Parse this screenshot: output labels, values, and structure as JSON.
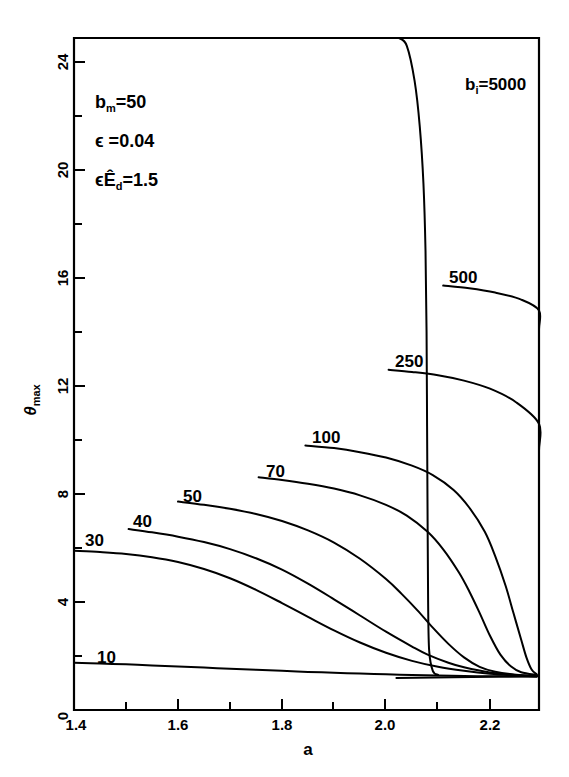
{
  "chart_data": {
    "type": "line",
    "title": "",
    "xlabel": "a",
    "ylabel": "θmax",
    "xlim": [
      1.4,
      2.29
    ],
    "ylim": [
      0,
      25.4
    ],
    "grid": false,
    "legend_position": "inline-curve-labels",
    "xticks": [
      1.4,
      1.6,
      1.8,
      2.0,
      2.2
    ],
    "xticklabels": [
      "1.4",
      "1.6",
      "1.8",
      "2.0",
      "2.2"
    ],
    "x_minor_ticks": [
      1.5,
      1.7,
      1.9,
      2.1,
      2.2
    ],
    "yticks": [
      0,
      4,
      8,
      12,
      16,
      20,
      24
    ],
    "yticklabels": [
      "0",
      "4",
      "8",
      "12",
      "16",
      "20",
      "24"
    ],
    "y_minor_ticks": [
      2,
      6,
      10,
      14,
      18,
      22
    ],
    "origin_label": "0",
    "asymptote_theta": 1.22,
    "series": [
      {
        "name": "10",
        "label": "10",
        "label_x": 1.47,
        "label_y": 2.45,
        "points": [
          [
            1.4,
            1.75
          ],
          [
            1.45,
            1.72
          ],
          [
            1.5,
            1.69
          ],
          [
            1.55,
            1.65
          ],
          [
            1.6,
            1.61
          ],
          [
            1.65,
            1.57
          ],
          [
            1.7,
            1.53
          ],
          [
            1.75,
            1.49
          ],
          [
            1.8,
            1.45
          ],
          [
            1.85,
            1.41
          ],
          [
            1.9,
            1.38
          ],
          [
            1.95,
            1.35
          ],
          [
            2.0,
            1.32
          ],
          [
            2.05,
            1.3
          ],
          [
            2.1,
            1.28
          ],
          [
            2.15,
            1.26
          ],
          [
            2.2,
            1.25
          ],
          [
            2.25,
            1.24
          ],
          [
            2.29,
            1.23
          ]
        ]
      },
      {
        "name": "30",
        "label": "30",
        "label_x": 1.445,
        "label_y": 6.75,
        "points": [
          [
            1.4,
            5.9
          ],
          [
            1.45,
            5.85
          ],
          [
            1.5,
            5.78
          ],
          [
            1.55,
            5.66
          ],
          [
            1.6,
            5.48
          ],
          [
            1.65,
            5.22
          ],
          [
            1.7,
            4.88
          ],
          [
            1.75,
            4.45
          ],
          [
            1.8,
            3.96
          ],
          [
            1.85,
            3.45
          ],
          [
            1.9,
            2.95
          ],
          [
            1.95,
            2.5
          ],
          [
            2.0,
            2.12
          ],
          [
            2.05,
            1.82
          ],
          [
            2.1,
            1.6
          ],
          [
            2.15,
            1.45
          ],
          [
            2.2,
            1.34
          ],
          [
            2.25,
            1.28
          ],
          [
            2.29,
            1.25
          ]
        ]
      },
      {
        "label": "40",
        "name": "40",
        "label_x": 1.54,
        "label_y": 7.45,
        "points": [
          [
            1.505,
            6.7
          ],
          [
            1.55,
            6.58
          ],
          [
            1.6,
            6.42
          ],
          [
            1.65,
            6.22
          ],
          [
            1.7,
            5.96
          ],
          [
            1.75,
            5.62
          ],
          [
            1.8,
            5.2
          ],
          [
            1.85,
            4.68
          ],
          [
            1.9,
            4.1
          ],
          [
            1.95,
            3.5
          ],
          [
            2.0,
            2.9
          ],
          [
            2.05,
            2.35
          ],
          [
            2.08,
            2.05
          ],
          [
            2.12,
            1.75
          ],
          [
            2.15,
            1.58
          ],
          [
            2.2,
            1.39
          ],
          [
            2.25,
            1.3
          ],
          [
            2.29,
            1.26
          ]
        ]
      },
      {
        "label": "50",
        "name": "50",
        "label_x": 1.635,
        "label_y": 8.4,
        "points": [
          [
            1.6,
            7.72
          ],
          [
            1.65,
            7.6
          ],
          [
            1.7,
            7.45
          ],
          [
            1.75,
            7.26
          ],
          [
            1.8,
            7.0
          ],
          [
            1.85,
            6.65
          ],
          [
            1.9,
            6.2
          ],
          [
            1.95,
            5.6
          ],
          [
            2.0,
            4.85
          ],
          [
            2.03,
            4.3
          ],
          [
            2.06,
            3.7
          ],
          [
            2.09,
            3.05
          ],
          [
            2.12,
            2.45
          ],
          [
            2.15,
            1.95
          ],
          [
            2.18,
            1.6
          ],
          [
            2.21,
            1.42
          ],
          [
            2.25,
            1.31
          ],
          [
            2.29,
            1.27
          ]
        ]
      },
      {
        "label": "70",
        "name": "70",
        "label_x": 1.795,
        "label_y": 9.3,
        "points": [
          [
            1.755,
            8.62
          ],
          [
            1.8,
            8.52
          ],
          [
            1.85,
            8.38
          ],
          [
            1.9,
            8.2
          ],
          [
            1.95,
            7.95
          ],
          [
            2.0,
            7.6
          ],
          [
            2.04,
            7.2
          ],
          [
            2.08,
            6.6
          ],
          [
            2.11,
            5.95
          ],
          [
            2.14,
            5.1
          ],
          [
            2.16,
            4.4
          ],
          [
            2.18,
            3.6
          ],
          [
            2.2,
            2.75
          ],
          [
            2.22,
            2.05
          ],
          [
            2.24,
            1.62
          ],
          [
            2.26,
            1.4
          ],
          [
            2.29,
            1.3
          ]
        ]
      },
      {
        "label": "100",
        "name": "100",
        "label_x": 1.885,
        "label_y": 10.55,
        "points": [
          [
            1.845,
            9.8
          ],
          [
            1.9,
            9.7
          ],
          [
            1.95,
            9.55
          ],
          [
            2.0,
            9.35
          ],
          [
            2.05,
            9.05
          ],
          [
            2.09,
            8.7
          ],
          [
            2.13,
            8.15
          ],
          [
            2.16,
            7.5
          ],
          [
            2.19,
            6.6
          ],
          [
            2.21,
            5.7
          ],
          [
            2.23,
            4.6
          ],
          [
            2.245,
            3.6
          ],
          [
            2.26,
            2.6
          ],
          [
            2.27,
            1.95
          ],
          [
            2.28,
            1.5
          ],
          [
            2.29,
            1.32
          ]
        ]
      },
      {
        "label": "250",
        "name": "250",
        "label_x": 2.045,
        "label_y": 13.4,
        "points": [
          [
            2.005,
            12.6
          ],
          [
            2.05,
            12.52
          ],
          [
            2.1,
            12.4
          ],
          [
            2.15,
            12.2
          ],
          [
            2.2,
            11.9
          ],
          [
            2.25,
            11.4
          ],
          [
            2.3,
            10.6
          ],
          [
            2.33,
            9.6
          ],
          [
            2.355,
            8.3
          ],
          [
            2.37,
            6.8
          ],
          [
            2.382,
            5.2
          ],
          [
            2.39,
            3.7
          ],
          [
            2.397,
            2.4
          ],
          [
            2.402,
            1.6
          ],
          [
            2.41,
            1.3
          ]
        ]
      },
      {
        "label": "500",
        "name": "500",
        "label_x": 2.15,
        "label_y": 16.5,
        "points": [
          [
            2.11,
            15.72
          ],
          [
            2.16,
            15.62
          ],
          [
            2.21,
            15.46
          ],
          [
            2.26,
            15.2
          ],
          [
            2.31,
            14.8
          ],
          [
            2.36,
            14.1
          ],
          [
            2.4,
            13.2
          ],
          [
            2.43,
            12.0
          ],
          [
            2.455,
            10.3
          ],
          [
            2.47,
            8.4
          ],
          [
            2.478,
            6.4
          ],
          [
            2.485,
            4.4
          ],
          [
            2.49,
            2.7
          ],
          [
            2.495,
            1.6
          ],
          [
            2.5,
            1.3
          ]
        ]
      },
      {
        "label": "bᵢ=5000",
        "name": "5000",
        "label_x": 2.245,
        "label_y": 22.8,
        "points": [
          [
            2.025,
            25.4
          ],
          [
            2.04,
            24.6
          ],
          [
            2.055,
            23.3
          ],
          [
            2.065,
            21.6
          ],
          [
            2.072,
            19.5
          ],
          [
            2.076,
            17.0
          ],
          [
            2.078,
            14.0
          ],
          [
            2.079,
            10.5
          ],
          [
            2.08,
            7.0
          ],
          [
            2.081,
            4.0
          ],
          [
            2.083,
            2.2
          ],
          [
            2.09,
            1.45
          ],
          [
            2.1,
            1.3
          ]
        ]
      }
    ],
    "annotations": [
      {
        "name": "bm",
        "text": "bₘ =50",
        "x": 1.465,
        "y": 22.3
      },
      {
        "name": "epsilon",
        "text": "ϵ =0.04",
        "x": 1.465,
        "y": 20.85
      },
      {
        "name": "epsilon-Ed",
        "text": "ϵÊₔ=1.5",
        "x": 1.465,
        "y": 19.4
      }
    ]
  },
  "labels": {
    "x_axis_title": "a",
    "y_axis_title_main": "θ",
    "y_axis_title_sub": "max",
    "origin": "0",
    "annotation_bm_base": "b",
    "annotation_bm_sub": "m",
    "annotation_bm_value": "=50",
    "annotation_eps_text": "ϵ =0.04",
    "annotation_epsEd_eps": "ϵ",
    "annotation_epsEd_E": "Ê",
    "annotation_epsEd_sub": "d",
    "annotation_epsEd_value": "=1.5",
    "curve_5000_base": "b",
    "curve_5000_sub": "i",
    "curve_5000_value": "=5000",
    "curve_10": "10",
    "curve_30": "30",
    "curve_40": "40",
    "curve_50": "50",
    "curve_70": "70",
    "curve_100": "100",
    "curve_250": "250",
    "curve_500": "500",
    "xtick_1": "1.4",
    "xtick_2": "1.6",
    "xtick_3": "1.8",
    "xtick_4": "2.0",
    "xtick_5": "2.2",
    "ytick_4": "4",
    "ytick_8": "8",
    "ytick_12": "12",
    "ytick_16": "16",
    "ytick_20": "20",
    "ytick_24": "24"
  },
  "colors": {
    "ink": "#000000",
    "background": "#ffffff"
  }
}
